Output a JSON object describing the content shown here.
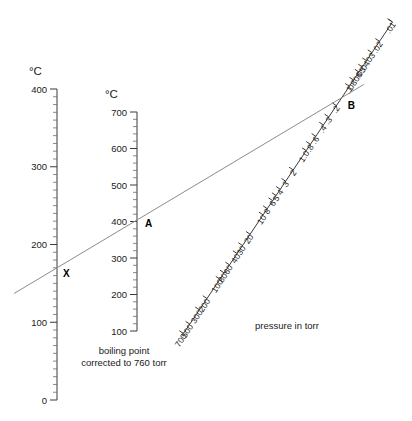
{
  "figure": {
    "type": "nomogram",
    "title": "",
    "background_color": "#ffffff",
    "line_color": "#3a3a3a",
    "connector_color": "#8c8c8c"
  },
  "left_axis": {
    "name": "observed-boiling-point-axis",
    "unit_label": "°C",
    "min": 0,
    "max": 400,
    "major_step": 100,
    "minor_step": 10,
    "tick_labels": [
      "400",
      "300",
      "200",
      "100",
      "0"
    ],
    "tick_values": [
      400,
      300,
      200,
      100,
      0
    ]
  },
  "middle_axis": {
    "name": "corrected-boiling-point-axis",
    "unit_label": "°C",
    "min": 100,
    "max": 700,
    "major_step": 100,
    "minor_step": 20,
    "tick_labels": [
      "700",
      "600",
      "500",
      "400",
      "300",
      "200",
      "100"
    ],
    "tick_values": [
      700,
      600,
      500,
      400,
      300,
      200,
      100
    ],
    "caption_line1": "boiling point",
    "caption_line2": "corrected to 760 torr"
  },
  "pressure_axis": {
    "name": "pressure-axis",
    "caption": "pressure in torr",
    "unit": "torr",
    "tick_labels": [
      ".01",
      ".02",
      ".03",
      ".04",
      ".05",
      ".06",
      ".08",
      ".1",
      ".2",
      ".3",
      ".4",
      ".6",
      ".8",
      "1.0",
      "2",
      "3",
      "4",
      "5",
      "6",
      "8",
      "10",
      "20",
      "30",
      "40",
      "60",
      "80",
      "100",
      "200",
      "300",
      "500",
      "700"
    ],
    "tick_values": [
      0.01,
      0.02,
      0.03,
      0.04,
      0.05,
      0.06,
      0.08,
      0.1,
      0.2,
      0.3,
      0.4,
      0.6,
      0.8,
      1.0,
      2,
      3,
      4,
      5,
      6,
      8,
      10,
      20,
      30,
      40,
      60,
      80,
      100,
      200,
      300,
      500,
      700
    ]
  },
  "markers": [
    {
      "name": "point-x",
      "label": "X",
      "axis": "left_axis",
      "value": 170
    },
    {
      "name": "point-a",
      "label": "A",
      "axis": "middle_axis",
      "value": 400
    },
    {
      "name": "point-b",
      "label": "B",
      "axis": "pressure_axis",
      "value": 0.15
    }
  ],
  "connector_line": {
    "name": "alignment-line",
    "from_label": "X",
    "to_label": "B",
    "through_label": "A"
  },
  "chart_data": {
    "type": "line",
    "xlabel": "",
    "ylabel": "",
    "series": [
      {
        "name": "observed boiling point (°C)",
        "axis": "left",
        "ticks": [
          400,
          300,
          200,
          100,
          0
        ],
        "ylim": [
          0,
          400
        ]
      },
      {
        "name": "boiling point corrected to 760 torr (°C)",
        "axis": "middle",
        "ticks": [
          700,
          600,
          500,
          400,
          300,
          200,
          100
        ],
        "ylim": [
          100,
          700
        ]
      },
      {
        "name": "pressure in torr",
        "axis": "diagonal-log",
        "ticks": [
          0.01,
          0.02,
          0.03,
          0.04,
          0.05,
          0.06,
          0.08,
          0.1,
          0.2,
          0.3,
          0.4,
          0.6,
          0.8,
          1.0,
          2,
          3,
          4,
          5,
          6,
          8,
          10,
          20,
          30,
          40,
          60,
          80,
          100,
          200,
          300,
          500,
          700
        ],
        "ylim": [
          0.01,
          700
        ]
      }
    ],
    "annotations": [
      {
        "label": "X",
        "series": "observed boiling point (°C)",
        "value": 170
      },
      {
        "label": "A",
        "series": "boiling point corrected to 760 torr (°C)",
        "value": 400
      },
      {
        "label": "B",
        "series": "pressure in torr",
        "value": 0.15
      }
    ],
    "grid": false,
    "legend": "none"
  }
}
